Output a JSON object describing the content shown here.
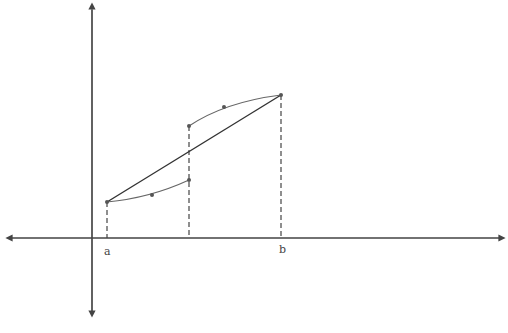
{
  "diagram": {
    "labels": {
      "a": "a",
      "b": "b"
    },
    "colors": {
      "axis": "#444444",
      "curve": "#666666",
      "secant": "#333333",
      "dashed": "#444444"
    },
    "axes": {
      "y_axis": {
        "x": 92,
        "y_top": 5,
        "y_bottom": 315
      },
      "x_axis": {
        "y": 238,
        "x_left": 8,
        "x_right": 503
      }
    },
    "points": {
      "a_point": {
        "x": 107,
        "y": 202
      },
      "lower_mid": {
        "x": 152,
        "y": 195
      },
      "lower_end": {
        "x": 189,
        "y": 180
      },
      "upper_start": {
        "x": 189,
        "y": 126
      },
      "upper_mid": {
        "x": 224,
        "y": 107
      },
      "b_point": {
        "x": 281,
        "y": 95
      }
    },
    "caption_partial": ""
  }
}
